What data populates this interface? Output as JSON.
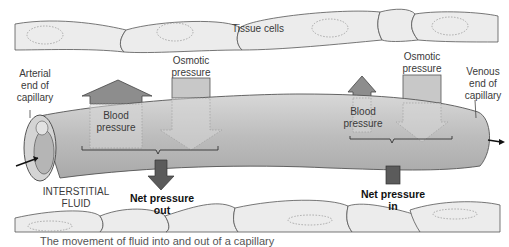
{
  "diagram": {
    "labels": {
      "tissue_cells": "Tissue cells",
      "arterial_end": [
        "Arterial",
        "end of",
        "capillary"
      ],
      "venous_end": [
        "Venous",
        "end of",
        "capillary"
      ],
      "osmotic_left": [
        "Osmotic",
        "pressure"
      ],
      "osmotic_right": [
        "Osmotic",
        "pressure"
      ],
      "blood_left": [
        "Blood",
        "pressure"
      ],
      "blood_right": [
        "Blood",
        "pressure"
      ],
      "interstitial": [
        "INTERSTITIAL",
        "FLUID"
      ],
      "net_out": [
        "Net pressure",
        "out"
      ],
      "net_in": [
        "Net pressure",
        "in"
      ]
    },
    "caption": "The movement of fluid into and out of a capillary",
    "colors": {
      "cell_fill": "#ececec",
      "capillary_fill": "#b9b9b9",
      "blood_arrow": "#8d8d8d",
      "osmotic_box": "#c8c8c8",
      "net_arrow": "#5b5b5b",
      "outline": "#444444"
    }
  }
}
